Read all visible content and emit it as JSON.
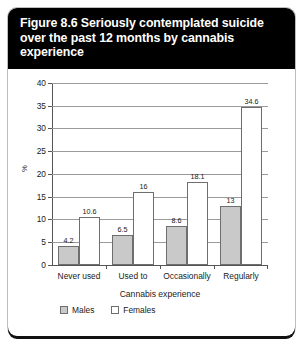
{
  "figure": {
    "title": "Figure 8.6 Seriously contemplated suicide over the past 12 months by cannabis experience"
  },
  "chart_data": {
    "type": "bar",
    "title": "Figure 8.6 Seriously contemplated suicide over the past 12 months by cannabis experience",
    "categories": [
      "Never used",
      "Used to",
      "Occasionally",
      "Regularly"
    ],
    "series": [
      {
        "name": "Males",
        "values": [
          4.2,
          6.5,
          8.6,
          13
        ]
      },
      {
        "name": "Females",
        "values": [
          10.6,
          16,
          18.1,
          34.6
        ]
      }
    ],
    "xlabel": "Cannabis experience",
    "ylabel": "%",
    "ylim": [
      0,
      40
    ],
    "yticks": [
      0,
      5,
      10,
      15,
      20,
      25,
      30,
      35,
      40
    ],
    "grid": true,
    "legend_position": "bottom-left",
    "colors": {
      "males": "#c9c9c9",
      "females": "#ffffff",
      "outline": "#6e6e6e"
    }
  }
}
